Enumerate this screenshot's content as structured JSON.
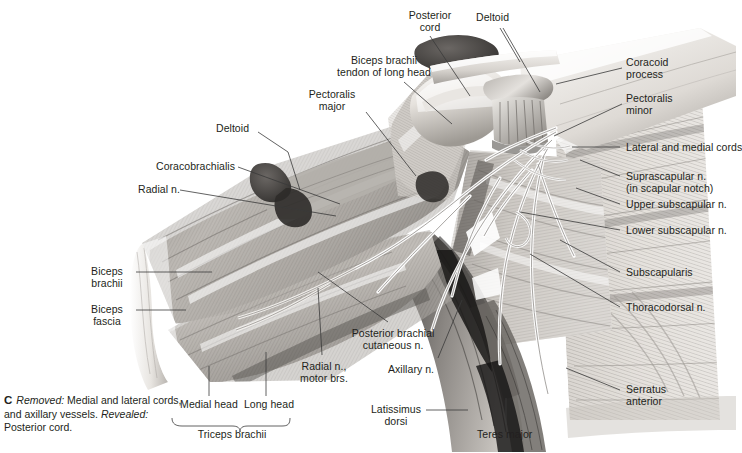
{
  "figure": {
    "plate_letter": "C",
    "caption_parts": {
      "removed_label": "Removed:",
      "removed_text": " Medial and lateral cords, and axillary vessels. ",
      "revealed_label": "Revealed:",
      "revealed_text": " Posterior cord."
    },
    "caption_plain": "C Removed: Medial and lateral cords, and axillary vessels. Revealed: Posterior cord."
  },
  "labels": {
    "posterior_cord": "Posterior\ncord",
    "deltoid_top": "Deltoid",
    "coracoid_process": "Coracoid\nprocess",
    "pectoralis_minor": "Pectoralis\nminor",
    "biceps_tendon_long_head": "Biceps brachii\ntendon of long head",
    "pectoralis_major": "Pectoralis\nmajor",
    "deltoid_left": "Deltoid",
    "lateral_and_medial_cords": "Lateral and medial cords",
    "coracobrachialis": "Coracobrachialis",
    "suprascapular_n": "Suprascapular n.\n(in scapular notch)",
    "radial_n": "Radial n.",
    "upper_subscapular_n": "Upper subscapular n.",
    "lower_subscapular_n": "Lower subscapular n.",
    "biceps_brachii": "Biceps\nbrachii",
    "subscapularis": "Subscapularis",
    "biceps_fascia": "Biceps\nfascia",
    "thoracodorsal_n": "Thoracodorsal n.",
    "posterior_brachial_cutaneous_n": "Posterior brachial\ncutaneous n.",
    "radial_n_motor_brs": "Radial n.,\nmotor brs.",
    "axillary_n": "Axillary n.",
    "serratus_anterior": "Serratus\nanterior",
    "medial_head": "Medial head",
    "long_head": "Long head",
    "triceps_brachii": "Triceps brachii",
    "latissimus_dorsi": "Latissimus\ndorsi",
    "teres_major": "Teres major"
  },
  "colors": {
    "text": "#231f20",
    "leader": "#3a3a3a",
    "background": "#ffffff",
    "muscle_light": "#d9d6d2",
    "muscle_mid": "#9d9a96",
    "muscle_dark": "#5c5a58",
    "bone": "#efece8",
    "shadow": "#2a2826",
    "nerve": "#f2f0ec"
  }
}
